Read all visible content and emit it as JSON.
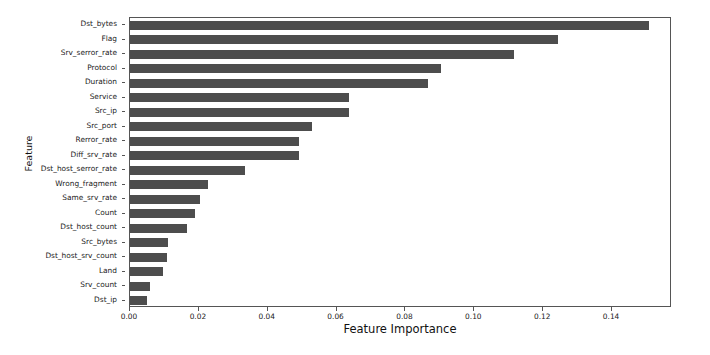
{
  "chart_data": {
    "type": "bar",
    "orientation": "horizontal",
    "title": "",
    "xlabel": "Feature Importance",
    "ylabel": "Feature",
    "xlim": [
      0.0,
      0.1574
    ],
    "grid": false,
    "legend": null,
    "bar_color": "#4d4d4d",
    "xticks": [
      0.0,
      0.02,
      0.04,
      0.06,
      0.08,
      0.1,
      0.12,
      0.14
    ],
    "xtick_labels": [
      "0.00",
      "0.02",
      "0.04",
      "0.06",
      "0.08",
      "0.10",
      "0.12",
      "0.14"
    ],
    "categories": [
      "Dst_bytes",
      "Flag",
      "Srv_serror_rate",
      "Protocol",
      "Duration",
      "Service",
      "Src_ip",
      "Src_port",
      "Rerror_rate",
      "Diff_srv_rate",
      "Dst_host_serror_rate",
      "Wrong_fragment",
      "Same_srv_rate",
      "Count",
      "Dst_host_count",
      "Src_bytes",
      "Dst_host_srv_count",
      "Land",
      "Srv_count",
      "Dst_ip"
    ],
    "values": [
      0.1507,
      0.1243,
      0.1115,
      0.0903,
      0.0865,
      0.0636,
      0.0636,
      0.0529,
      0.0491,
      0.0491,
      0.0334,
      0.0227,
      0.0203,
      0.0189,
      0.0166,
      0.011,
      0.0107,
      0.0096,
      0.0058,
      0.0049
    ]
  },
  "axes": {
    "x_title": "Feature Importance",
    "y_title": "Feature"
  }
}
